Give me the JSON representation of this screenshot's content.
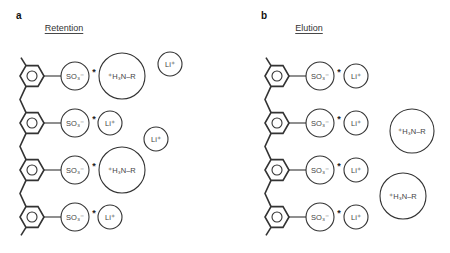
{
  "panels": [
    {
      "letter": "a",
      "title": "Retention",
      "hex_x": 32,
      "so3_x": 75,
      "rows": [
        {
          "y": 76,
          "partner": {
            "label": "⁺H₃N–R",
            "kind": "amine",
            "x": 122,
            "r": 23
          }
        },
        {
          "y": 123,
          "partner": {
            "label": "Li⁺",
            "kind": "lithium",
            "x": 110,
            "r": 12
          }
        },
        {
          "y": 170,
          "partner": {
            "label": "⁺H₃N–R",
            "kind": "amine",
            "x": 122,
            "r": 23
          }
        },
        {
          "y": 217,
          "partner": {
            "label": "Li⁺",
            "kind": "lithium",
            "x": 110,
            "r": 12
          }
        }
      ],
      "free_ions": [
        {
          "label": "Li⁺",
          "kind": "lithium",
          "x": 170,
          "y": 64,
          "r": 12
        },
        {
          "label": "Li⁺",
          "kind": "lithium",
          "x": 156,
          "y": 139,
          "r": 12
        }
      ]
    },
    {
      "letter": "b",
      "title": "Elution",
      "hex_x": 277,
      "so3_x": 320,
      "rows": [
        {
          "y": 76,
          "partner": {
            "label": "Li⁺",
            "kind": "lithium",
            "x": 356,
            "r": 12
          }
        },
        {
          "y": 123,
          "partner": {
            "label": "Li⁺",
            "kind": "lithium",
            "x": 356,
            "r": 12
          }
        },
        {
          "y": 170,
          "partner": {
            "label": "Li⁺",
            "kind": "lithium",
            "x": 356,
            "r": 12
          }
        },
        {
          "y": 217,
          "partner": {
            "label": "Li⁺",
            "kind": "lithium",
            "x": 356,
            "r": 12
          }
        }
      ],
      "free_ions": [
        {
          "label": "⁺H₃N–R",
          "kind": "amine",
          "x": 412,
          "y": 131,
          "r": 22
        },
        {
          "label": "⁺H₃N–R",
          "kind": "amine",
          "x": 403,
          "y": 196,
          "r": 23
        }
      ]
    }
  ],
  "sulfonate_label": "SO₃⁻",
  "pair_marker": "*",
  "colors": {
    "line": "#333333",
    "text": "#444444",
    "background": "#ffffff"
  }
}
